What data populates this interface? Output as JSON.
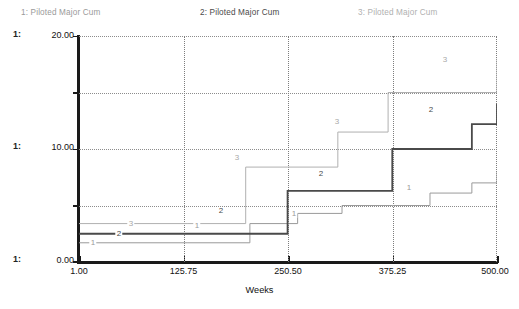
{
  "legend": [
    {
      "id": "1",
      "label": "1: Piloted Major Cum",
      "color": "#9a9a9a"
    },
    {
      "id": "2",
      "label": "2: Piloted Major Cum",
      "color": "#4a4a4a"
    },
    {
      "id": "3",
      "label": "3: Piloted Major Cum",
      "color": "#b0b0b0"
    }
  ],
  "scale_tags": {
    "top": "1:",
    "mid": "1:",
    "bottom": "1:"
  },
  "axis": {
    "y_ticks": [
      "20.00",
      "10.00",
      "0.00"
    ],
    "x_ticks": [
      "1.00",
      "125.75",
      "250.50",
      "375.25",
      "500.00"
    ],
    "x_title": "Weeks"
  },
  "chart_data": {
    "type": "line",
    "title": "",
    "subtitle": "",
    "xlabel": "Weeks",
    "ylabel": "",
    "xlim": [
      1.0,
      500.0
    ],
    "ylim": [
      0.0,
      20.0
    ],
    "xticks": [
      1.0,
      125.75,
      250.5,
      375.25,
      500.0
    ],
    "yticks": [
      0.0,
      5.0,
      10.0,
      15.0,
      20.0
    ],
    "grid": true,
    "grid_style": "dotted",
    "legend_position": "top",
    "interpolation": "step-post",
    "series": [
      {
        "name": "1: Piloted Major Cum",
        "marker_label": "1",
        "color": "#9a9a9a",
        "width": 1.0,
        "x": [
          1,
          130,
          205,
          262,
          315,
          375,
          420,
          470,
          500
        ],
        "y": [
          1.7,
          1.7,
          3.4,
          4.3,
          5.0,
          5.0,
          6.1,
          7.0,
          8.0
        ]
      },
      {
        "name": "2: Piloted Major Cum",
        "marker_label": "2",
        "color": "#4a4a4a",
        "width": 1.8,
        "x": [
          1,
          130,
          250,
          310,
          375,
          420,
          470,
          500
        ],
        "y": [
          2.5,
          2.5,
          6.3,
          6.3,
          10.0,
          10.0,
          12.2,
          14.0
        ]
      },
      {
        "name": "3: Piloted Major Cum",
        "marker_label": "3",
        "color": "#b0b0b0",
        "width": 1.0,
        "x": [
          1,
          130,
          200,
          250,
          310,
          370,
          420,
          500
        ],
        "y": [
          3.4,
          3.4,
          8.4,
          8.4,
          11.5,
          15.0,
          15.0,
          18.0
        ]
      }
    ],
    "inline_markers": [
      {
        "series": "1",
        "label": "1",
        "x_px": 14,
        "y_px": 207
      },
      {
        "series": "2",
        "label": "2",
        "x_px": 40,
        "y_px": 198
      },
      {
        "series": "3",
        "label": "3",
        "x_px": 52,
        "y_px": 188
      },
      {
        "series": "1",
        "label": "1",
        "x_px": 118,
        "y_px": 190
      },
      {
        "series": "2",
        "label": "2",
        "x_px": 142,
        "y_px": 175
      },
      {
        "series": "3",
        "label": "3",
        "x_px": 158,
        "y_px": 122
      },
      {
        "series": "1",
        "label": "1",
        "x_px": 215,
        "y_px": 178
      },
      {
        "series": "2",
        "label": "2",
        "x_px": 242,
        "y_px": 138
      },
      {
        "series": "3",
        "label": "3",
        "x_px": 258,
        "y_px": 86
      },
      {
        "series": "1",
        "label": "1",
        "x_px": 330,
        "y_px": 152
      },
      {
        "series": "2",
        "label": "2",
        "x_px": 352,
        "y_px": 74
      },
      {
        "series": "3",
        "label": "3",
        "x_px": 366,
        "y_px": 24
      }
    ]
  }
}
